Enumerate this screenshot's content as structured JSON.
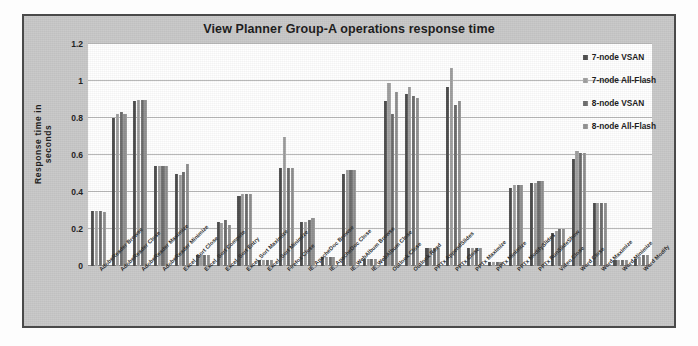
{
  "chart_data": {
    "type": "bar",
    "title": "View Planner Group-A operations response time",
    "xlabel": "",
    "ylabel": "Response time in seconds",
    "ylim": [
      0,
      1.2
    ],
    "yticks": [
      "0",
      "0.2",
      "0.4",
      "0.6",
      "0.8",
      "1",
      "1.2"
    ],
    "grid": true,
    "legend_position": "right",
    "categories": [
      "AdobeReader Browse",
      "AdobeReader Close",
      "AdobeReader Maximize",
      "AdobeReader Minimize",
      "Excel_Sort Close",
      "Excel_Sort Compute",
      "Excel_Sort Entry",
      "Excel_Sort Maximize",
      "Excel_Sort Minimize",
      "Firefox Close",
      "IE_ApacheDoc Browse",
      "IE_ApacheDoc Close",
      "IE_WebAlbum Browse",
      "IE_WebAlbum Close",
      "Outlook Close",
      "Outlook Read",
      "PPTx AppendSlides",
      "PPTx Close",
      "PPTx Maximize",
      "PPTx Minimize",
      "PPTx ModifySlides",
      "PPTx RunSlideShow",
      "Video Close",
      "Word Close",
      "Word Maximize",
      "Word Minimize",
      "Word Modify"
    ],
    "series": [
      {
        "name": "7-node VSAN",
        "color": "#4a4a4a",
        "values": [
          0.3,
          0.8,
          0.89,
          0.54,
          0.5,
          0.06,
          0.24,
          0.38,
          0.03,
          0.53,
          0.24,
          0.05,
          0.5,
          0.04,
          0.89,
          0.93,
          0.1,
          0.97,
          0.1,
          0.02,
          0.42,
          0.45,
          0.18,
          0.58,
          0.34,
          0.03,
          0.04
        ]
      },
      {
        "name": "7-node All-Flash",
        "color": "#9b9b9b",
        "values": [
          0.3,
          0.82,
          0.9,
          0.54,
          0.49,
          0.06,
          0.23,
          0.39,
          0.03,
          0.7,
          0.24,
          0.05,
          0.52,
          0.04,
          0.99,
          0.97,
          0.1,
          1.07,
          0.1,
          0.02,
          0.44,
          0.45,
          0.19,
          0.62,
          0.34,
          0.03,
          0.05
        ]
      },
      {
        "name": "8-node VSAN",
        "color": "#6a6a6a",
        "values": [
          0.3,
          0.83,
          0.9,
          0.54,
          0.51,
          0.06,
          0.25,
          0.39,
          0.03,
          0.53,
          0.25,
          0.05,
          0.52,
          0.04,
          0.82,
          0.92,
          0.1,
          0.87,
          0.1,
          0.02,
          0.44,
          0.46,
          0.2,
          0.61,
          0.34,
          0.03,
          0.06
        ]
      },
      {
        "name": "8-node All-Flash",
        "color": "#8d8d8d",
        "values": [
          0.29,
          0.82,
          0.9,
          0.54,
          0.55,
          0.06,
          0.22,
          0.39,
          0.03,
          0.53,
          0.26,
          0.05,
          0.52,
          0.04,
          0.94,
          0.91,
          0.1,
          0.89,
          0.1,
          0.02,
          0.44,
          0.46,
          0.2,
          0.61,
          0.34,
          0.03,
          0.06
        ]
      }
    ]
  }
}
